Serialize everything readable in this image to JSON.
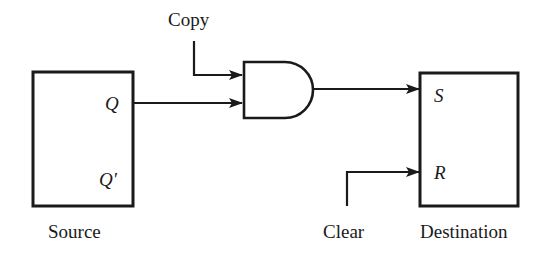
{
  "diagram": {
    "type": "logic-circuit",
    "colors": {
      "ink": "#1a1a1a",
      "background": "#ffffff"
    },
    "blocks": {
      "source": {
        "label": "Source",
        "pins": [
          "Q",
          "Q'"
        ]
      },
      "destination": {
        "label": "Destination",
        "pins": [
          "S",
          "R"
        ]
      },
      "gate": {
        "kind": "AND"
      }
    },
    "signals": {
      "copy": "Copy",
      "clear": "Clear"
    },
    "connections": [
      {
        "from": "Source.Q",
        "to": "AND.in2"
      },
      {
        "from": "Copy",
        "to": "AND.in1"
      },
      {
        "from": "AND.out",
        "to": "Destination.S"
      },
      {
        "from": "Clear",
        "to": "Destination.R"
      }
    ]
  }
}
